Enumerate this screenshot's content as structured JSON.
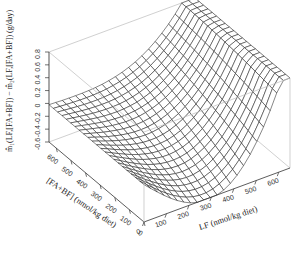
{
  "chart_data": {
    "type": "surface3d",
    "title": "",
    "zlabel": "m̂₁(LF,[FA+BF]) − m̂₂(LF,[FA+BF])  (g/day)",
    "xlabel": "LF (nmol/kg diet)",
    "ylabel": "[FA+BF] (nmol/kg diet)",
    "x_ticks": [
      0,
      100,
      200,
      300,
      400,
      500,
      600
    ],
    "y_ticks": [
      0,
      100,
      200,
      300,
      400,
      500,
      600
    ],
    "z_ticks": [
      -0.6,
      -0.4,
      -0.2,
      0,
      0.2,
      0.4,
      0.6,
      0.8
    ],
    "xlim": [
      0,
      650
    ],
    "ylim": [
      0,
      650
    ],
    "zlim": [
      -0.6,
      0.8
    ],
    "grid_size": 22,
    "surface_description": "Near 0 across most of [FA+BF] at LF=0; dips to about -0.6 at low [FA+BF] and mid LF; rises sharply to about 0.7 at high LF",
    "colors": {
      "mesh": "#222222",
      "box": "#bbbbbb",
      "axis": "#333333"
    }
  }
}
